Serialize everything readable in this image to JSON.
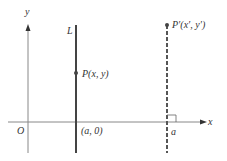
{
  "diagram": {
    "type": "reflection-in-vertical-line",
    "axes": {
      "x_label": "x",
      "y_label": "y",
      "origin_label": "O"
    },
    "line_L": {
      "label": "L",
      "foot_label": "(a, 0)"
    },
    "point_P": {
      "label": "P(x, y)"
    },
    "reflection_line": {
      "style": "dashed",
      "foot_label": "a",
      "right_angle_marker": true
    },
    "point_P_prime": {
      "label": "P′(x′, y′)"
    },
    "colors": {
      "axes": "#888888",
      "line_L": "#444444",
      "dashed_line": "#555555",
      "text": "#333333"
    }
  }
}
